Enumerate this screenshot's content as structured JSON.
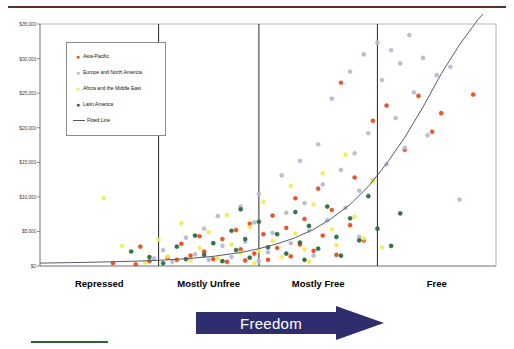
{
  "chart_data": {
    "type": "scatter",
    "title": "",
    "xlabel": "Freedom",
    "ylabel": "",
    "categories": [
      "Repressed",
      "Mostly Unfree",
      "Mostly Free",
      "Free"
    ],
    "ylim": [
      0,
      35000
    ],
    "yticks": [
      0,
      5000,
      10000,
      15000,
      20000,
      25000,
      30000,
      35000
    ],
    "ytick_labels": [
      "$0",
      "$5,000",
      "$10,000",
      "$15,000",
      "$20,000",
      "$25,000",
      "$30,000",
      "$35,000"
    ],
    "xlim": [
      0,
      100
    ],
    "grid": false,
    "legend_position": "upper-left",
    "category_boundaries": [
      0,
      26,
      48,
      74,
      100
    ],
    "series": [
      {
        "name": "Asia-Pacific",
        "color": "#e2501e",
        "points": [
          [
            16,
            400
          ],
          [
            21,
            250
          ],
          [
            24,
            700
          ],
          [
            22,
            2800
          ],
          [
            28,
            1200
          ],
          [
            30,
            900
          ],
          [
            31,
            3200
          ],
          [
            33,
            1500
          ],
          [
            35,
            4300
          ],
          [
            36,
            2100
          ],
          [
            38,
            1000
          ],
          [
            40,
            3900
          ],
          [
            41,
            600
          ],
          [
            43,
            5200
          ],
          [
            44,
            2400
          ],
          [
            45,
            800
          ],
          [
            46,
            6100
          ],
          [
            47,
            1800
          ],
          [
            49,
            4600
          ],
          [
            50,
            900
          ],
          [
            51,
            7300
          ],
          [
            52,
            2600
          ],
          [
            54,
            5500
          ],
          [
            55,
            1400
          ],
          [
            56,
            9800
          ],
          [
            57,
            3100
          ],
          [
            58,
            6800
          ],
          [
            60,
            2200
          ],
          [
            61,
            11200
          ],
          [
            62,
            4400
          ],
          [
            64,
            8100
          ],
          [
            65,
            1600
          ],
          [
            66,
            26500
          ],
          [
            68,
            5900
          ],
          [
            69,
            12800
          ],
          [
            71,
            3700
          ],
          [
            73,
            21000
          ],
          [
            76,
            23200
          ],
          [
            80,
            16800
          ],
          [
            83,
            24600
          ],
          [
            86,
            19400
          ],
          [
            88,
            22100
          ],
          [
            95,
            24800
          ]
        ]
      },
      {
        "name": "Europe and North America",
        "color": "#b9b9cf",
        "points": [
          [
            25,
            1100
          ],
          [
            27,
            2300
          ],
          [
            29,
            600
          ],
          [
            32,
            4100
          ],
          [
            34,
            1700
          ],
          [
            36,
            5400
          ],
          [
            37,
            900
          ],
          [
            39,
            7200
          ],
          [
            40,
            2900
          ],
          [
            42,
            1300
          ],
          [
            44,
            8600
          ],
          [
            45,
            3500
          ],
          [
            47,
            6300
          ],
          [
            48,
            10400
          ],
          [
            50,
            2000
          ],
          [
            51,
            4800
          ],
          [
            53,
            13100
          ],
          [
            54,
            7700
          ],
          [
            55,
            3300
          ],
          [
            57,
            15200
          ],
          [
            58,
            9100
          ],
          [
            59,
            5100
          ],
          [
            61,
            17600
          ],
          [
            62,
            11800
          ],
          [
            63,
            6600
          ],
          [
            64,
            24200
          ],
          [
            66,
            13900
          ],
          [
            67,
            8400
          ],
          [
            68,
            28100
          ],
          [
            69,
            16300
          ],
          [
            70,
            10900
          ],
          [
            71,
            30600
          ],
          [
            72,
            19200
          ],
          [
            73,
            12400
          ],
          [
            74,
            32300
          ],
          [
            75,
            26900
          ],
          [
            76,
            14700
          ],
          [
            77,
            31200
          ],
          [
            78,
            21400
          ],
          [
            79,
            29300
          ],
          [
            80,
            17100
          ],
          [
            81,
            33400
          ],
          [
            82,
            25100
          ],
          [
            84,
            30100
          ],
          [
            85,
            18900
          ],
          [
            87,
            27600
          ],
          [
            90,
            28800
          ],
          [
            92,
            9600
          ],
          [
            70,
            4200
          ],
          [
            60,
            1500
          ],
          [
            48,
            700
          ]
        ]
      },
      {
        "name": "Africa and the Middle East",
        "color": "#f2ea5a",
        "points": [
          [
            14,
            9800
          ],
          [
            18,
            2900
          ],
          [
            23,
            500
          ],
          [
            26,
            3800
          ],
          [
            28,
            1400
          ],
          [
            31,
            6200
          ],
          [
            33,
            800
          ],
          [
            35,
            2600
          ],
          [
            37,
            4900
          ],
          [
            39,
            1100
          ],
          [
            41,
            7400
          ],
          [
            42,
            3100
          ],
          [
            44,
            1900
          ],
          [
            46,
            5600
          ],
          [
            48,
            2200
          ],
          [
            49,
            9300
          ],
          [
            51,
            3600
          ],
          [
            53,
            1300
          ],
          [
            55,
            11600
          ],
          [
            56,
            4700
          ],
          [
            58,
            2400
          ],
          [
            60,
            8900
          ],
          [
            62,
            13400
          ],
          [
            64,
            5300
          ],
          [
            65,
            3000
          ],
          [
            67,
            16100
          ],
          [
            69,
            7100
          ],
          [
            71,
            4000
          ],
          [
            73,
            12200
          ],
          [
            75,
            2700
          ],
          [
            47,
            400
          ],
          [
            59,
            600
          ]
        ]
      },
      {
        "name": "Latin America",
        "color": "#2c6b3f",
        "points": [
          [
            20,
            2100
          ],
          [
            24,
            1300
          ],
          [
            27,
            400
          ],
          [
            30,
            2800
          ],
          [
            32,
            1000
          ],
          [
            34,
            4400
          ],
          [
            36,
            1600
          ],
          [
            38,
            3300
          ],
          [
            40,
            700
          ],
          [
            42,
            5100
          ],
          [
            43,
            2300
          ],
          [
            45,
            3900
          ],
          [
            46,
            1200
          ],
          [
            48,
            6400
          ],
          [
            50,
            2700
          ],
          [
            52,
            4600
          ],
          [
            54,
            1800
          ],
          [
            56,
            7800
          ],
          [
            57,
            3400
          ],
          [
            59,
            5800
          ],
          [
            61,
            2500
          ],
          [
            63,
            8600
          ],
          [
            65,
            4200
          ],
          [
            66,
            1500
          ],
          [
            68,
            6900
          ],
          [
            70,
            3700
          ],
          [
            72,
            10100
          ],
          [
            74,
            5400
          ],
          [
            77,
            2900
          ],
          [
            79,
            7600
          ],
          [
            44,
            8200
          ],
          [
            58,
            900
          ]
        ]
      }
    ],
    "fitted_line": {
      "name": "Fitted Line",
      "color": "#5a5a66",
      "points": [
        [
          0,
          420
        ],
        [
          10,
          520
        ],
        [
          20,
          680
        ],
        [
          26,
          820
        ],
        [
          32,
          1050
        ],
        [
          38,
          1400
        ],
        [
          44,
          1950
        ],
        [
          48,
          2500
        ],
        [
          52,
          3200
        ],
        [
          56,
          4100
        ],
        [
          60,
          5300
        ],
        [
          64,
          6900
        ],
        [
          68,
          8900
        ],
        [
          72,
          11500
        ],
        [
          76,
          14800
        ],
        [
          80,
          18600
        ],
        [
          84,
          23000
        ],
        [
          88,
          27800
        ],
        [
          92,
          32000
        ],
        [
          96,
          35600
        ],
        [
          100,
          38500
        ]
      ]
    }
  },
  "legend": {
    "items": [
      {
        "label": "Asia-Pacific",
        "marker": "dot-marker"
      },
      {
        "label": "Europe and North America",
        "marker": "dot-marker"
      },
      {
        "label": "Africa and the Middle East",
        "marker": "dot-marker"
      },
      {
        "label": "Latin America",
        "marker": "dot-marker"
      }
    ],
    "line_label": "Fitted Line"
  },
  "banner": {
    "label": "Freedom",
    "color": "#2e2e6e"
  },
  "decor": {
    "top_rule_color": "#5b3026",
    "bottom_rule_color": "#2f6330"
  }
}
